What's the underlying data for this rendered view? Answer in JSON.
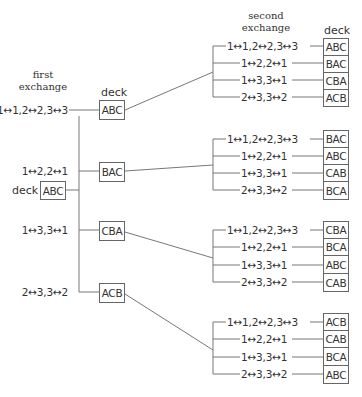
{
  "header": {
    "first_line1": "first",
    "first_line2": "exchange",
    "second_line1": "second",
    "second_line2": "exchange",
    "deck_word": "deck"
  },
  "start": {
    "label": "deck",
    "deck": "ABC"
  },
  "first_exchange": [
    {
      "exchange": "1↔1,2↔2,3↔3",
      "deck": "ABC"
    },
    {
      "exchange": "1↔2,2↔1",
      "deck": "BAC"
    },
    {
      "exchange": "1↔3,3↔1",
      "deck": "CBA"
    },
    {
      "exchange": "2↔3,3↔2",
      "deck": "ACB"
    }
  ],
  "second_exchange": [
    {
      "rows": [
        {
          "exchange": "1↔1,2↔2,3↔3",
          "deck": "ABC"
        },
        {
          "exchange": "1↔2,2↔1",
          "deck": "BAC"
        },
        {
          "exchange": "1↔3,3↔1",
          "deck": "CBA"
        },
        {
          "exchange": "2↔3,3↔2",
          "deck": "ACB"
        }
      ]
    },
    {
      "rows": [
        {
          "exchange": "1↔1,2↔2,3↔3",
          "deck": "BAC"
        },
        {
          "exchange": "1↔2,2↔1",
          "deck": "ABC"
        },
        {
          "exchange": "1↔3,3↔1",
          "deck": "CAB"
        },
        {
          "exchange": "2↔3,3↔2",
          "deck": "BCA"
        }
      ]
    },
    {
      "rows": [
        {
          "exchange": "1↔1,2↔2,3↔3",
          "deck": "CBA"
        },
        {
          "exchange": "1↔2,2↔1",
          "deck": "BCA"
        },
        {
          "exchange": "1↔3,3↔1",
          "deck": "ABC"
        },
        {
          "exchange": "2↔3,3↔2",
          "deck": "CAB"
        }
      ]
    },
    {
      "rows": [
        {
          "exchange": "1↔1,2↔2,3↔3",
          "deck": "ACB"
        },
        {
          "exchange": "1↔2,2↔1",
          "deck": "CAB"
        },
        {
          "exchange": "1↔3,3↔1",
          "deck": "BCA"
        },
        {
          "exchange": "2↔3,3↔2",
          "deck": "ABC"
        }
      ]
    }
  ]
}
